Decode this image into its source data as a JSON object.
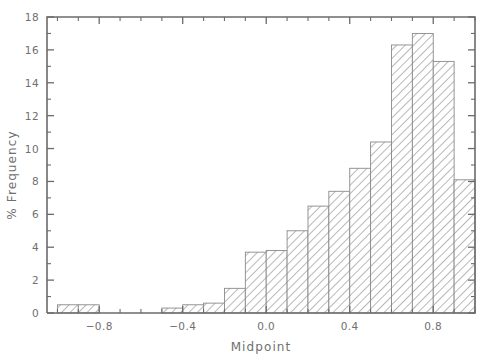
{
  "chart_data": {
    "type": "bar",
    "title": "",
    "xlabel": "Midpoint",
    "ylabel": "% Frequency",
    "xlim": [
      -1.05,
      1.0
    ],
    "ylim": [
      0,
      18
    ],
    "grid": false,
    "legend": null,
    "bar_width": 0.1,
    "x_ticks": [
      "-0.8",
      "-0.4",
      "0.0",
      "0.4",
      "0.8"
    ],
    "x_tick_values": [
      -0.8,
      -0.4,
      0.0,
      0.4,
      0.8
    ],
    "x_minor_tick_values": [
      -1.0,
      -0.9,
      -0.7,
      -0.6,
      -0.5,
      -0.3,
      -0.2,
      -0.1,
      0.1,
      0.2,
      0.3,
      0.5,
      0.6,
      0.7,
      0.9,
      1.0
    ],
    "y_ticks": [
      "0",
      "2",
      "4",
      "6",
      "8",
      "10",
      "12",
      "14",
      "16",
      "18"
    ],
    "y_tick_values": [
      0,
      2,
      4,
      6,
      8,
      10,
      12,
      14,
      16,
      18
    ],
    "y_minor_tick_values": [
      1,
      3,
      5,
      7,
      9,
      11,
      13,
      15,
      17
    ],
    "categories": [
      -0.95,
      -0.85,
      -0.75,
      -0.65,
      -0.55,
      -0.45,
      -0.35,
      -0.25,
      -0.15,
      -0.05,
      0.05,
      0.15,
      0.25,
      0.35,
      0.45,
      0.55,
      0.65,
      0.75,
      0.85
    ],
    "values": [
      0.5,
      0.5,
      0,
      0,
      0,
      0.3,
      0.5,
      0.6,
      1.5,
      3.7,
      3.8,
      5.0,
      6.5,
      7.4,
      8.8,
      10.4,
      16.3,
      17.0,
      15.3
    ],
    "series": [
      {
        "name": "% Frequency",
        "values": [
          0.5,
          0.5,
          0,
          0,
          0,
          0.3,
          0.5,
          0.6,
          1.5,
          3.7,
          3.8,
          5.0,
          6.5,
          7.4,
          8.8,
          10.4,
          16.3,
          17.0,
          15.3
        ]
      }
    ],
    "last_bar_value": 8.1,
    "colors": {
      "axis": "#6b6b6b",
      "text": "#6f6f6f",
      "bar_edge": "#8a8a8a",
      "bar_hatch": "#9a9a9a",
      "background": "#ffffff"
    }
  }
}
